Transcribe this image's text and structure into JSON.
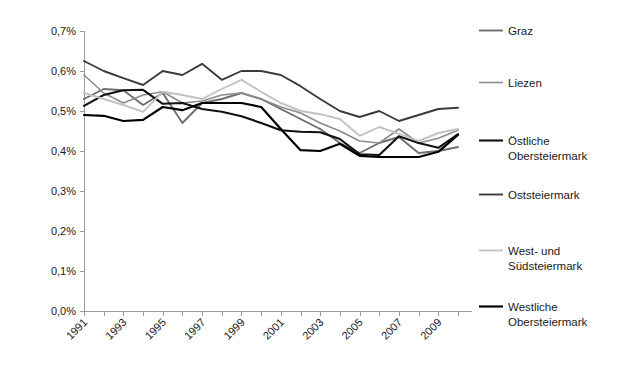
{
  "chart_data": {
    "type": "line",
    "title": "",
    "subtitle": "",
    "xlabel": "",
    "ylabel": "",
    "grid": false,
    "legend_position": "right",
    "x": [
      1991,
      1992,
      1993,
      1994,
      1995,
      1996,
      1997,
      1998,
      1999,
      2000,
      2001,
      2002,
      2003,
      2004,
      2005,
      2006,
      2007,
      2008,
      2009,
      2010
    ],
    "xtick_labels": [
      "1991",
      "1993",
      "1995",
      "1997",
      "1999",
      "2001",
      "2003",
      "2005",
      "2007",
      "2009"
    ],
    "xtick_values": [
      1991,
      1993,
      1995,
      1997,
      1999,
      2001,
      2003,
      2005,
      2007,
      2009
    ],
    "ytick_labels": [
      "0,0%",
      "0,1%",
      "0,2%",
      "0,3%",
      "0,4%",
      "0,5%",
      "0,6%",
      "0,7%"
    ],
    "ytick_values": [
      0.0,
      0.1,
      0.2,
      0.3,
      0.4,
      0.5,
      0.6,
      0.7
    ],
    "ylim": [
      0.0,
      0.7
    ],
    "series": [
      {
        "name": "Graz",
        "color": "#6e6e6e",
        "width": 1.9,
        "values": [
          0.53,
          0.555,
          0.552,
          0.515,
          0.545,
          0.47,
          0.52,
          0.53,
          0.545,
          0.53,
          0.505,
          0.48,
          0.455,
          0.42,
          0.395,
          0.42,
          0.435,
          0.395,
          0.4,
          0.41
        ]
      },
      {
        "name": "Liezen",
        "color": "#8c8c8c",
        "width": 1.6,
        "values": [
          0.59,
          0.545,
          0.52,
          0.54,
          0.548,
          0.52,
          0.525,
          0.54,
          0.545,
          0.53,
          0.51,
          0.495,
          0.47,
          0.45,
          0.425,
          0.42,
          0.455,
          0.42,
          0.432,
          0.452
        ]
      },
      {
        "name": "Östliche Obersteiermark",
        "color": "#111111",
        "width": 2.1,
        "values": [
          0.513,
          0.54,
          0.552,
          0.553,
          0.518,
          0.52,
          0.505,
          0.498,
          0.487,
          0.47,
          0.452,
          0.448,
          0.447,
          0.43,
          0.392,
          0.39,
          0.437,
          0.42,
          0.408,
          0.442
        ]
      },
      {
        "name": "Oststeiermark",
        "color": "#3b3b3b",
        "width": 1.9,
        "values": [
          0.625,
          0.6,
          0.582,
          0.565,
          0.6,
          0.59,
          0.618,
          0.578,
          0.6,
          0.6,
          0.59,
          0.562,
          0.53,
          0.5,
          0.485,
          0.5,
          0.475,
          0.49,
          0.505,
          0.508
        ]
      },
      {
        "name": "West- und Südsteiermark",
        "color": "#c2c2c2",
        "width": 1.9,
        "values": [
          0.545,
          0.53,
          0.515,
          0.498,
          0.548,
          0.54,
          0.53,
          0.555,
          0.578,
          0.548,
          0.52,
          0.5,
          0.492,
          0.48,
          0.438,
          0.46,
          0.443,
          0.425,
          0.445,
          0.455
        ]
      },
      {
        "name": "Westliche Obersteiermark",
        "color": "#000000",
        "width": 2.2,
        "values": [
          0.49,
          0.488,
          0.475,
          0.478,
          0.51,
          0.502,
          0.52,
          0.52,
          0.52,
          0.51,
          0.455,
          0.402,
          0.4,
          0.418,
          0.388,
          0.385,
          0.385,
          0.385,
          0.398,
          0.44
        ]
      }
    ]
  },
  "legend": {
    "items": [
      {
        "label": "Graz",
        "label2": ""
      },
      {
        "label": "Liezen",
        "label2": ""
      },
      {
        "label": "Östliche",
        "label2": "Obersteiermark"
      },
      {
        "label": "Oststeiermark",
        "label2": ""
      },
      {
        "label": "West- und",
        "label2": "Südsteiermark"
      },
      {
        "label": "Westliche",
        "label2": "Obersteiermark"
      }
    ]
  },
  "colors": {
    "axis": "#9a9a9a",
    "text": "#1a1a1a",
    "background": "#ffffff"
  }
}
